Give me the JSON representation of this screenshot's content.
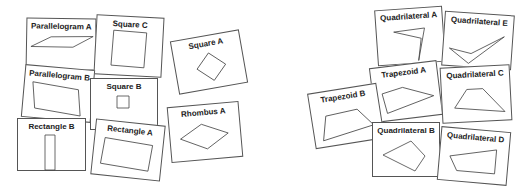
{
  "cards": [
    {
      "label": "Parallelogram A"
    },
    {
      "label": "Square C"
    },
    {
      "label": "Square A"
    },
    {
      "label": "Parallelogram B"
    },
    {
      "label": "Square B"
    },
    {
      "label": "Rhombus A"
    },
    {
      "label": "Rectangle B"
    },
    {
      "label": "Rectangle A"
    },
    {
      "label": "Quadrilateral A"
    },
    {
      "label": "Quadrilateral E"
    },
    {
      "label": "Trapezoid A"
    },
    {
      "label": "Quadrilateral C"
    },
    {
      "label": "Trapezoid B"
    },
    {
      "label": "Quadrilateral B"
    },
    {
      "label": "Quadrilateral D"
    }
  ]
}
